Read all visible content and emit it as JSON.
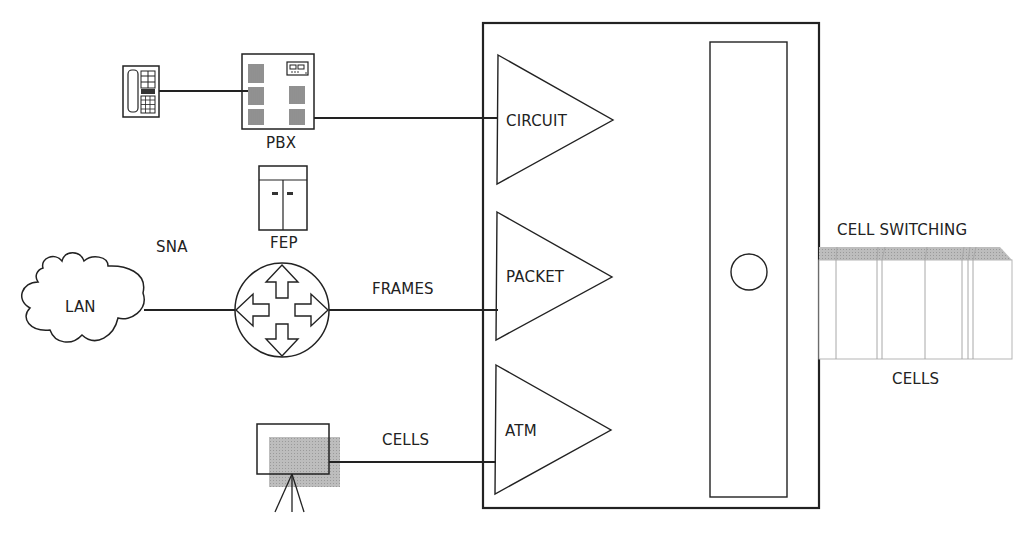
{
  "diagram": {
    "type": "network-multiplexing",
    "devices": {
      "telephone": {
        "label": ""
      },
      "pbx": {
        "label": "PBX"
      },
      "fep": {
        "label": "FEP"
      },
      "sna": {
        "label": "SNA"
      },
      "lan": {
        "label": "LAN"
      },
      "router": {
        "label": ""
      },
      "video_camera": {
        "label": ""
      }
    },
    "links": {
      "frames": {
        "label": "FRAMES"
      },
      "cells_in": {
        "label": "CELLS"
      }
    },
    "switch": {
      "inputs": [
        {
          "label": "CIRCUIT"
        },
        {
          "label": "PACKET"
        },
        {
          "label": "ATM"
        }
      ]
    },
    "output": {
      "title": "CELL SWITCHING",
      "caption": "CELLS"
    },
    "colors": {
      "line": "#222222",
      "shade": "#b0b0b0"
    }
  }
}
